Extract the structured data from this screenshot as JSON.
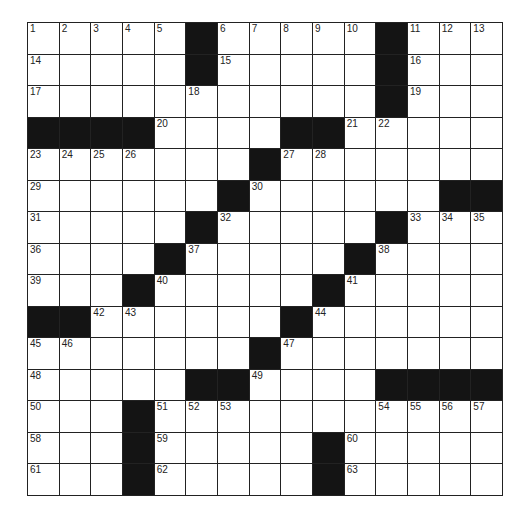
{
  "puzzle": {
    "size": {
      "rows": 15,
      "cols": 15
    },
    "colors": {
      "block": "#141414",
      "cell": "#ffffff",
      "line": "#222222"
    },
    "layout": [
      ".....#.....#...",
      ".....#.....#...",
      "...........#...",
      "####....##.....",
      ".......#.......",
      "......#......##",
      ".....#.....#...",
      "....#.....#....",
      "...#.....#.....",
      "##......#......",
      ".......#.......",
      ".....##....####",
      "...#...........",
      "...#.....#.....",
      "...#.....#....."
    ],
    "numbers": [
      {
        "r": 0,
        "c": 0,
        "n": "1"
      },
      {
        "r": 0,
        "c": 1,
        "n": "2"
      },
      {
        "r": 0,
        "c": 2,
        "n": "3"
      },
      {
        "r": 0,
        "c": 3,
        "n": "4"
      },
      {
        "r": 0,
        "c": 4,
        "n": "5"
      },
      {
        "r": 0,
        "c": 6,
        "n": "6"
      },
      {
        "r": 0,
        "c": 7,
        "n": "7"
      },
      {
        "r": 0,
        "c": 8,
        "n": "8"
      },
      {
        "r": 0,
        "c": 9,
        "n": "9"
      },
      {
        "r": 0,
        "c": 10,
        "n": "10"
      },
      {
        "r": 0,
        "c": 12,
        "n": "11"
      },
      {
        "r": 0,
        "c": 13,
        "n": "12"
      },
      {
        "r": 0,
        "c": 14,
        "n": "13"
      },
      {
        "r": 1,
        "c": 0,
        "n": "14"
      },
      {
        "r": 1,
        "c": 6,
        "n": "15"
      },
      {
        "r": 1,
        "c": 12,
        "n": "16"
      },
      {
        "r": 2,
        "c": 0,
        "n": "17"
      },
      {
        "r": 2,
        "c": 5,
        "n": "18"
      },
      {
        "r": 2,
        "c": 12,
        "n": "19"
      },
      {
        "r": 3,
        "c": 4,
        "n": "20"
      },
      {
        "r": 3,
        "c": 10,
        "n": "21"
      },
      {
        "r": 3,
        "c": 11,
        "n": "22"
      },
      {
        "r": 4,
        "c": 0,
        "n": "23"
      },
      {
        "r": 4,
        "c": 1,
        "n": "24"
      },
      {
        "r": 4,
        "c": 2,
        "n": "25"
      },
      {
        "r": 4,
        "c": 3,
        "n": "26"
      },
      {
        "r": 4,
        "c": 8,
        "n": "27"
      },
      {
        "r": 4,
        "c": 9,
        "n": "28"
      },
      {
        "r": 5,
        "c": 0,
        "n": "29"
      },
      {
        "r": 5,
        "c": 7,
        "n": "30"
      },
      {
        "r": 6,
        "c": 0,
        "n": "31"
      },
      {
        "r": 6,
        "c": 6,
        "n": "32"
      },
      {
        "r": 6,
        "c": 12,
        "n": "33"
      },
      {
        "r": 6,
        "c": 13,
        "n": "34"
      },
      {
        "r": 6,
        "c": 14,
        "n": "35"
      },
      {
        "r": 7,
        "c": 0,
        "n": "36"
      },
      {
        "r": 7,
        "c": 5,
        "n": "37"
      },
      {
        "r": 7,
        "c": 11,
        "n": "38"
      },
      {
        "r": 8,
        "c": 0,
        "n": "39"
      },
      {
        "r": 8,
        "c": 4,
        "n": "40"
      },
      {
        "r": 8,
        "c": 10,
        "n": "41"
      },
      {
        "r": 9,
        "c": 2,
        "n": "42"
      },
      {
        "r": 9,
        "c": 3,
        "n": "43"
      },
      {
        "r": 9,
        "c": 9,
        "n": "44"
      },
      {
        "r": 10,
        "c": 0,
        "n": "45"
      },
      {
        "r": 10,
        "c": 1,
        "n": "46"
      },
      {
        "r": 10,
        "c": 8,
        "n": "47"
      },
      {
        "r": 11,
        "c": 0,
        "n": "48"
      },
      {
        "r": 11,
        "c": 7,
        "n": "49"
      },
      {
        "r": 12,
        "c": 0,
        "n": "50"
      },
      {
        "r": 12,
        "c": 4,
        "n": "51"
      },
      {
        "r": 12,
        "c": 5,
        "n": "52"
      },
      {
        "r": 12,
        "c": 6,
        "n": "53"
      },
      {
        "r": 12,
        "c": 11,
        "n": "54"
      },
      {
        "r": 12,
        "c": 12,
        "n": "55"
      },
      {
        "r": 12,
        "c": 13,
        "n": "56"
      },
      {
        "r": 12,
        "c": 14,
        "n": "57"
      },
      {
        "r": 13,
        "c": 0,
        "n": "58"
      },
      {
        "r": 13,
        "c": 4,
        "n": "59"
      },
      {
        "r": 13,
        "c": 10,
        "n": "60"
      },
      {
        "r": 14,
        "c": 0,
        "n": "61"
      },
      {
        "r": 14,
        "c": 4,
        "n": "62"
      },
      {
        "r": 14,
        "c": 10,
        "n": "63"
      }
    ]
  }
}
